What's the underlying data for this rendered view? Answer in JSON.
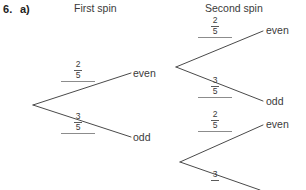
{
  "question": {
    "number": "6.",
    "part": "a)"
  },
  "headers": {
    "first_spin": "First spin",
    "second_spin": "Second spin"
  },
  "outcomes": {
    "first_even": "even",
    "first_odd": "odd",
    "second_even_from_even": "even",
    "second_odd_from_even": "odd",
    "second_even_from_odd": "even"
  },
  "probabilities": {
    "first_even": {
      "numerator": "2",
      "denominator": "5"
    },
    "first_odd": {
      "numerator": "3",
      "denominator": "5"
    },
    "even_then_even": {
      "numerator": "2",
      "denominator": "5"
    },
    "even_then_odd": {
      "numerator": "3",
      "denominator": "5"
    },
    "odd_then_even": {
      "numerator": "2",
      "denominator": "5"
    },
    "odd_then_odd": {
      "numerator": "3",
      "denominator": "5"
    }
  },
  "colors": {
    "ink": "#3a3a3a",
    "branch_line": "#4a4a4a",
    "rule_line": "#8c8c8c",
    "background": "#ffffff"
  },
  "tree": {
    "type": "probability-tree",
    "root": {
      "x": 33,
      "y": 105
    },
    "nodes": [
      {
        "id": "first-even",
        "x": 176,
        "y": 67,
        "label": "even"
      },
      {
        "id": "first-odd",
        "x": 180,
        "y": 162,
        "label": "odd"
      }
    ]
  }
}
